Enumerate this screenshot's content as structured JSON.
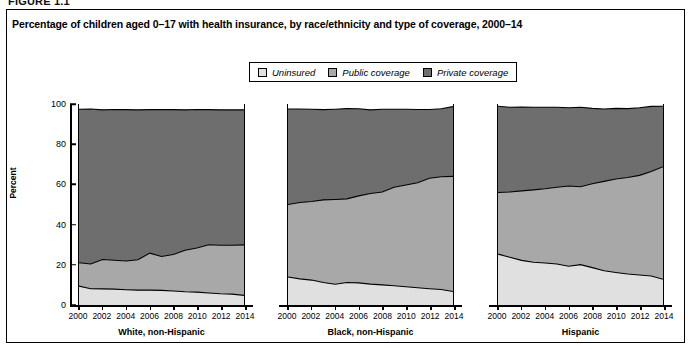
{
  "figure": {
    "label": "FIGURE 1.1",
    "title": "Percentage of children aged 0–17 with health insurance, by race/ethnicity and type of coverage, 2000–14"
  },
  "legend": {
    "position": "top-center",
    "items": [
      {
        "label": "Uninsured",
        "swatch_name": "uninsured-swatch",
        "color": "#e0e0e0"
      },
      {
        "label": "Public coverage",
        "swatch_name": "public-swatch",
        "color": "#a8a8a8"
      },
      {
        "label": "Private coverage",
        "swatch_name": "private-swatch",
        "color": "#6e6e6e"
      }
    ]
  },
  "axes": {
    "ylabel": "Percent",
    "yticks": [
      "0",
      "20",
      "40",
      "60",
      "80",
      "100"
    ],
    "ylim": [
      0,
      100
    ],
    "xticks": [
      "2000",
      "2002",
      "2004",
      "2006",
      "2008",
      "2010",
      "2012",
      "2014"
    ],
    "grid": false
  },
  "chart_data": {
    "type": "area",
    "title": "Percentage of children aged 0–17 with health insurance, by race/ethnicity and type of coverage, 2000–14",
    "xlabel": "",
    "ylabel": "Percent",
    "ylim": [
      0,
      100
    ],
    "stacked": true,
    "x": [
      2000,
      2001,
      2002,
      2003,
      2004,
      2005,
      2006,
      2007,
      2008,
      2009,
      2010,
      2011,
      2012,
      2013,
      2014
    ],
    "legend": [
      "Uninsured",
      "Public coverage",
      "Private coverage"
    ],
    "panels": [
      {
        "name": "White, non-Hispanic",
        "series": [
          {
            "name": "Uninsured",
            "values": [
              9.4,
              8.1,
              8.0,
              7.9,
              7.6,
              7.4,
              7.4,
              7.3,
              7.0,
              6.6,
              6.4,
              6.0,
              5.6,
              5.4,
              4.8
            ]
          },
          {
            "name": "Public coverage",
            "values": [
              11.6,
              12.3,
              14.6,
              14.4,
              14.3,
              15.1,
              18.4,
              16.8,
              18.1,
              20.6,
              22.0,
              24.0,
              24.1,
              24.3,
              25.1
            ]
          },
          {
            "name": "Private coverage",
            "values": [
              76.4,
              77.1,
              74.5,
              75.0,
              75.3,
              74.6,
              71.4,
              73.2,
              72.1,
              69.9,
              68.9,
              67.2,
              67.4,
              67.4,
              67.2
            ]
          }
        ],
        "boundaries": {
          "uninsured_top": [
            9.4,
            8.1,
            8.0,
            7.9,
            7.6,
            7.4,
            7.4,
            7.3,
            7.0,
            6.6,
            6.4,
            6.0,
            5.6,
            5.4,
            4.8
          ],
          "public_top": [
            21.0,
            20.4,
            22.6,
            22.3,
            21.9,
            22.5,
            25.8,
            24.1,
            25.1,
            27.2,
            28.4,
            30.0,
            29.7,
            29.7,
            29.9
          ],
          "private_top": [
            97.4,
            97.5,
            97.1,
            97.3,
            97.2,
            97.1,
            97.2,
            97.3,
            97.2,
            97.1,
            97.3,
            97.2,
            97.1,
            97.1,
            97.1
          ]
        }
      },
      {
        "name": "Black, non-Hispanic",
        "series": [
          {
            "name": "Uninsured",
            "values": [
              13.9,
              13.0,
              12.4,
              11.2,
              10.3,
              11.2,
              11.0,
              10.4,
              10.0,
              9.6,
              9.1,
              8.6,
              8.1,
              7.7,
              6.7
            ]
          },
          {
            "name": "Public coverage",
            "values": [
              36.1,
              38.0,
              39.1,
              41.1,
              42.2,
              41.6,
              43.3,
              45.1,
              46.2,
              49.0,
              50.6,
              52.2,
              55.0,
              56.1,
              57.3
            ]
          },
          {
            "name": "Private coverage",
            "values": [
              47.5,
              46.5,
              45.9,
              44.9,
              44.9,
              44.9,
              43.3,
              41.6,
              41.2,
              38.8,
              37.7,
              36.5,
              34.2,
              33.8,
              34.7
            ]
          }
        ],
        "boundaries": {
          "uninsured_top": [
            13.9,
            13.0,
            12.4,
            11.2,
            10.3,
            11.2,
            11.0,
            10.4,
            10.0,
            9.6,
            9.1,
            8.6,
            8.1,
            7.7,
            6.7
          ],
          "public_top": [
            50.0,
            51.0,
            51.5,
            52.3,
            52.5,
            52.8,
            54.3,
            55.5,
            56.2,
            58.6,
            59.7,
            60.8,
            63.1,
            63.8,
            64.0
          ],
          "private_top": [
            97.5,
            97.5,
            97.4,
            97.2,
            97.4,
            97.7,
            97.6,
            97.1,
            97.4,
            97.4,
            97.4,
            97.3,
            97.3,
            97.6,
            98.7
          ]
        }
      },
      {
        "name": "Hispanic",
        "series": [
          {
            "name": "Uninsured",
            "values": [
              25.3,
              23.8,
              22.2,
              21.3,
              20.9,
              20.4,
              19.3,
              20.1,
              18.6,
              17.0,
              16.2,
              15.4,
              14.9,
              14.4,
              12.8
            ]
          },
          {
            "name": "Public coverage",
            "values": [
              30.7,
              32.4,
              34.6,
              36.0,
              36.9,
              38.2,
              39.9,
              38.7,
              41.7,
              44.5,
              46.5,
              48.0,
              49.6,
              52.0,
              56.0
            ]
          },
          {
            "name": "Private coverage",
            "values": [
              42.9,
              42.2,
              41.7,
              41.1,
              40.6,
              39.8,
              38.9,
              39.6,
              37.5,
              36.0,
              35.1,
              34.3,
              33.6,
              32.4,
              30.1
            ]
          }
        ],
        "boundaries": {
          "uninsured_top": [
            25.3,
            23.8,
            22.2,
            21.3,
            20.9,
            20.4,
            19.3,
            20.1,
            18.6,
            17.0,
            16.2,
            15.4,
            14.9,
            14.4,
            12.8
          ],
          "public_top": [
            56.0,
            56.2,
            56.8,
            57.3,
            57.8,
            58.6,
            59.2,
            58.8,
            60.3,
            61.5,
            62.7,
            63.4,
            64.5,
            66.4,
            68.8
          ],
          "private_top": [
            98.9,
            98.4,
            98.5,
            98.4,
            98.4,
            98.4,
            98.1,
            98.4,
            97.8,
            97.5,
            97.8,
            97.7,
            98.1,
            98.8,
            98.9
          ]
        }
      }
    ]
  }
}
